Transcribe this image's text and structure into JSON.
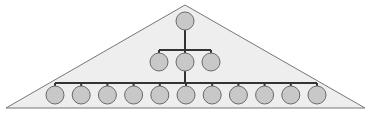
{
  "diagram": {
    "type": "hierarchy-pyramid",
    "colors": {
      "background": "#ffffff",
      "triangle_fill": "#eeeeee",
      "triangle_stroke": "#777777",
      "node_fill": "#c8c8c8",
      "node_stroke": "#6a6a6a",
      "connector": "#333333"
    },
    "triangle": {
      "apex": [
        185,
        5
      ],
      "left": [
        6,
        108
      ],
      "right": [
        365,
        108
      ]
    },
    "node_radius": 9,
    "levels": [
      {
        "level": 1,
        "count": 1,
        "y": 21,
        "x_start": 185,
        "spacing": 0,
        "bar_y": null
      },
      {
        "level": 2,
        "count": 3,
        "y": 62,
        "x_start": 159,
        "spacing": 26,
        "bar_y": 50
      },
      {
        "level": 3,
        "count": 11,
        "y": 95,
        "x_start": 55,
        "spacing": 26.2,
        "bar_y": 83
      }
    ]
  }
}
